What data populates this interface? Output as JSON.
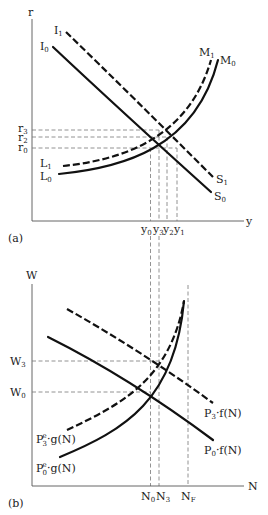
{
  "panels": {
    "a": {
      "caption": "(a)",
      "y_axis_label": "r",
      "x_axis_label": "y",
      "curves": {
        "I0": {
          "start": "I",
          "start_sub": "0",
          "end": "S",
          "end_sub": "0"
        },
        "I1": {
          "start": "I",
          "start_sub": "1",
          "end": "S",
          "end_sub": "1"
        },
        "L0": {
          "start": "L",
          "start_sub": "0",
          "end": "M",
          "end_sub": "0"
        },
        "L1": {
          "start": "L",
          "start_sub": "1",
          "end": "M",
          "end_sub": "1"
        }
      },
      "y_ticks": [
        {
          "base": "r",
          "sub": "3"
        },
        {
          "base": "r",
          "sub": "2"
        },
        {
          "base": "r",
          "sub": "0"
        }
      ],
      "x_ticks": [
        {
          "base": "y",
          "sub": "0"
        },
        {
          "base": "y",
          "sub": "3"
        },
        {
          "base": "y",
          "sub": "2"
        },
        {
          "base": "y",
          "sub": "1"
        }
      ]
    },
    "b": {
      "caption": "(b)",
      "y_axis_label": "W",
      "x_axis_label": "N",
      "curves": {
        "demand3": {
          "pre": "P",
          "sub": "3",
          "post": "·f(N)"
        },
        "demand0": {
          "pre": "P",
          "sub": "0",
          "post": "·f(N)"
        },
        "supply3": {
          "pre": "P",
          "sup": "e",
          "sub": "3",
          "post": "·g(N)"
        },
        "supply0": {
          "pre": "P",
          "sup": "e",
          "sub": "0",
          "post": "·g(N)"
        }
      },
      "y_ticks": [
        {
          "base": "W",
          "sub": "3"
        },
        {
          "base": "W",
          "sub": "0"
        }
      ],
      "x_ticks": [
        {
          "base": "N",
          "sub": "0"
        },
        {
          "base": "N",
          "sub": "3"
        },
        {
          "base": "N",
          "sub": "F"
        }
      ]
    }
  }
}
